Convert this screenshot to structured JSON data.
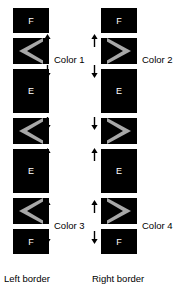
{
  "diagram": {
    "colors": {
      "block_fill": "#000000",
      "chevron_gray": "#a8a8a8",
      "chevron_black": "#000000",
      "text_on_block": "#ffffff",
      "text": "#000000",
      "background": "#ffffff"
    },
    "columns": [
      {
        "id": "left",
        "caption": "Left border",
        "direction": "left",
        "blocks": [
          {
            "kind": "solid",
            "label": "F"
          },
          {
            "kind": "chevron",
            "label": ""
          },
          {
            "kind": "solid",
            "label": "E"
          },
          {
            "kind": "chevron",
            "label": ""
          },
          {
            "kind": "solid",
            "label": "E"
          },
          {
            "kind": "chevron",
            "label": ""
          },
          {
            "kind": "solid",
            "label": "F"
          }
        ],
        "color_labels": [
          {
            "text": "Color 1"
          },
          {
            "text": "Color 3"
          }
        ],
        "arrows": [
          {
            "dir": "up"
          },
          {
            "dir": "down"
          },
          {
            "dir": "down"
          },
          {
            "dir": "up"
          },
          {
            "dir": "up"
          },
          {
            "dir": "down"
          }
        ]
      },
      {
        "id": "right",
        "caption": "Right border",
        "direction": "right",
        "blocks": [
          {
            "kind": "solid",
            "label": "F"
          },
          {
            "kind": "chevron",
            "label": ""
          },
          {
            "kind": "solid",
            "label": "E"
          },
          {
            "kind": "chevron",
            "label": ""
          },
          {
            "kind": "solid",
            "label": "E"
          },
          {
            "kind": "chevron",
            "label": ""
          },
          {
            "kind": "solid",
            "label": "F"
          }
        ],
        "color_labels": [
          {
            "text": "Color 2"
          },
          {
            "text": "Color 4"
          }
        ],
        "arrows": [
          {
            "dir": "up"
          },
          {
            "dir": "down"
          },
          {
            "dir": "down"
          },
          {
            "dir": "up"
          },
          {
            "dir": "up"
          },
          {
            "dir": "down"
          }
        ]
      }
    ]
  }
}
